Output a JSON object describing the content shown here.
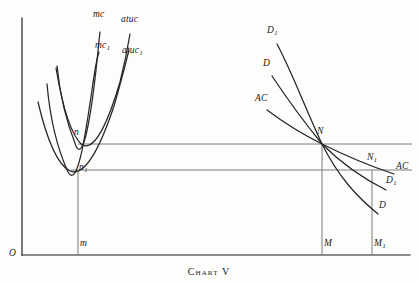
{
  "caption": "Chart V",
  "chart_data": {
    "type": "line",
    "title": "Chart V",
    "subtitle": "",
    "xlabel": "",
    "ylabel": "",
    "grid": false,
    "legend": "inline-curve-labels",
    "axes": {
      "origin_label": "O",
      "x_axis": {
        "x_start": 22,
        "x_end": 410,
        "y": 255
      },
      "y_axis": {
        "x": 22,
        "y_top": 18,
        "y_bottom": 255
      }
    },
    "price_levels": [
      {
        "name": "upper-price-line",
        "y": 144,
        "x_start": 78,
        "x_end": 412,
        "through": [
          "n",
          "N"
        ]
      },
      {
        "name": "lower-price-line",
        "y": 170,
        "x_start": 70,
        "x_end": 412,
        "through": [
          "n1",
          "N1"
        ]
      }
    ],
    "quantity_droplines": [
      {
        "name": "m",
        "x": 78,
        "y_top": 170,
        "y_bottom": 255
      },
      {
        "name": "M",
        "x": 322,
        "y_top": 144,
        "y_bottom": 255
      },
      {
        "name": "M1",
        "x": 372,
        "y_top": 170,
        "y_bottom": 255
      }
    ],
    "intersection_points": [
      {
        "label": "n",
        "x": 82,
        "y": 144,
        "panel": "left"
      },
      {
        "label": "n1",
        "x": 78,
        "y": 170,
        "panel": "left"
      },
      {
        "label": "N",
        "x": 322,
        "y": 144,
        "panel": "right"
      },
      {
        "label": "N1",
        "x": 372,
        "y": 170,
        "panel": "right"
      }
    ],
    "series": [
      {
        "name": "mc",
        "label": "mc",
        "panel": "left",
        "description": "marginal cost, firm 1 - steep rising curve",
        "path": "M 57,66 C 60,96 68,126 76,146 C 84,164 92,106 96,70 C 98,52 99,40 100,32"
      },
      {
        "name": "mc1",
        "label": "mc₁",
        "panel": "left",
        "description": "marginal cost, firm 2 - steep rising curve shifted right/down",
        "path": "M 47,84 C 50,118 58,150 68,172 C 78,190 86,130 92,90 C 95,68 97,58 99,52"
      },
      {
        "name": "atuc",
        "label": "atuc",
        "panel": "left",
        "description": "average total unit cost, U-shaped minimum at n",
        "path": "M 56,68 C 62,104 70,134 82,145 C 96,152 110,116 120,82 C 125,62 128,46 130,34"
      },
      {
        "name": "atuc1",
        "label": "atuc₁",
        "panel": "left",
        "description": "average total unit cost alternative, U-shaped minimum at n1",
        "path": "M 38,102 C 46,136 56,164 70,171 C 86,178 102,142 114,106 C 121,82 126,62 129,50"
      },
      {
        "name": "D1",
        "label": "D₁",
        "panel": "right",
        "description": "higher demand curve through N and N1",
        "path": "M 277,44 C 292,72 306,110 322,144 C 338,176 356,196 378,214"
      },
      {
        "name": "D",
        "label": "D",
        "panel": "right",
        "description": "demand curve through N steeper decline to D1 label",
        "path": "M 272,76 C 288,100 304,122 322,144 C 342,164 362,178 386,190"
      },
      {
        "name": "AC",
        "label": "AC",
        "panel": "right",
        "description": "average cost / flatter line through N and N1 to AC label",
        "path": "M 267,110 C 283,122 302,134 322,144 C 346,156 370,166 394,174"
      }
    ],
    "curve_labels": [
      {
        "text": "mc",
        "x": 93,
        "y": 14,
        "panel": "left"
      },
      {
        "text": "mc₁",
        "x": 95,
        "y": 45,
        "panel": "left"
      },
      {
        "text": "atuc",
        "x": 123,
        "y": 19,
        "panel": "left"
      },
      {
        "text": "atuc₁",
        "x": 124,
        "y": 50,
        "panel": "left"
      },
      {
        "text": "D₁",
        "x": 268,
        "y": 30,
        "panel": "right"
      },
      {
        "text": "D",
        "x": 263,
        "y": 63,
        "panel": "right"
      },
      {
        "text": "AC",
        "x": 256,
        "y": 98,
        "panel": "right"
      },
      {
        "text": "AC",
        "x": 396,
        "y": 166,
        "panel": "right"
      },
      {
        "text": "D₁",
        "x": 387,
        "y": 179,
        "panel": "right"
      },
      {
        "text": "D",
        "x": 379,
        "y": 204,
        "panel": "right"
      }
    ],
    "point_labels": [
      {
        "text": "n",
        "x": 74,
        "y": 131
      },
      {
        "text": "n₁",
        "x": 79,
        "y": 166
      },
      {
        "text": "N",
        "x": 318,
        "y": 130
      },
      {
        "text": "N₁",
        "x": 368,
        "y": 156
      }
    ],
    "axis_labels": [
      {
        "text": "O",
        "x": 10,
        "y": 252
      },
      {
        "text": "m",
        "x": 80,
        "y": 242
      },
      {
        "text": "M",
        "x": 324,
        "y": 242
      },
      {
        "text": "M₁",
        "x": 374,
        "y": 242
      }
    ]
  }
}
